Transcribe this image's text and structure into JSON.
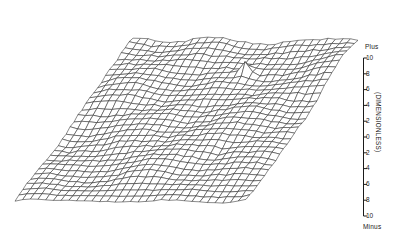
{
  "chart_data": {
    "type": "surface",
    "title": "",
    "subtitle": "",
    "xlabel": "",
    "ylabel": "(DIMENSIONLESS)",
    "zlabel": "",
    "grid": false,
    "legend_position": "none",
    "projection": "parallelogram-oblique",
    "axis": {
      "orientation": "vertical",
      "position": "right",
      "top_label": "Plus",
      "bottom_label": "Minus",
      "unit_label": "(DIMENSIONLESS)",
      "range": [
        -10,
        10
      ],
      "tick_interval": 2,
      "tick_labels": [
        "10",
        "8",
        "6",
        "4",
        "2",
        "0",
        "2",
        "4",
        "6",
        "8",
        "10"
      ],
      "tick_values": [
        10,
        8,
        6,
        4,
        2,
        0,
        -2,
        -4,
        -6,
        -8,
        -10
      ]
    },
    "mesh": {
      "rows": 16,
      "cols": 16,
      "line_color": "#2b2b2b",
      "fill_color": "#ffffff",
      "amplitude_range": [
        -3.2,
        9.5
      ],
      "spike": {
        "present": true,
        "approx_value": 9.5,
        "location": "back-right"
      },
      "z_values": [
        [
          0.4,
          1.0,
          1.5,
          1.1,
          0.5,
          1.2,
          1.9,
          1.4,
          0.9,
          1.6,
          2.2,
          1.7,
          1.1,
          1.8,
          2.4,
          1.9
        ],
        [
          0.8,
          1.4,
          2.0,
          1.5,
          0.9,
          1.6,
          2.3,
          1.8,
          1.2,
          2.0,
          2.6,
          2.1,
          1.5,
          2.2,
          2.8,
          2.3
        ],
        [
          1.2,
          1.8,
          1.3,
          1.9,
          1.4,
          2.0,
          1.5,
          2.1,
          1.6,
          2.2,
          1.7,
          2.3,
          1.8,
          2.4,
          1.9,
          2.5
        ],
        [
          0.9,
          1.5,
          2.1,
          1.6,
          1.0,
          1.7,
          2.4,
          1.9,
          1.3,
          2.1,
          2.7,
          2.2,
          1.6,
          2.3,
          2.9,
          2.4
        ],
        [
          1.5,
          0.9,
          1.6,
          2.2,
          1.7,
          1.1,
          1.8,
          2.5,
          2.0,
          1.4,
          2.2,
          2.8,
          2.3,
          1.7,
          2.4,
          3.0
        ],
        [
          0.6,
          1.2,
          1.8,
          1.3,
          0.7,
          1.4,
          2.1,
          1.6,
          1.0,
          1.8,
          2.4,
          1.9,
          1.3,
          2.0,
          2.6,
          2.1
        ],
        [
          1.1,
          1.7,
          1.2,
          1.8,
          1.3,
          1.9,
          1.4,
          2.0,
          1.5,
          2.1,
          1.6,
          2.2,
          1.7,
          2.3,
          1.8,
          2.4
        ],
        [
          1.6,
          1.0,
          1.7,
          2.3,
          1.8,
          1.2,
          1.9,
          2.6,
          2.1,
          1.5,
          2.3,
          2.9,
          2.4,
          1.8,
          2.5,
          3.1
        ],
        [
          0.7,
          1.3,
          1.9,
          1.4,
          0.8,
          1.5,
          2.2,
          1.7,
          1.1,
          1.9,
          2.5,
          2.0,
          1.4,
          2.1,
          2.7,
          2.2
        ],
        [
          1.3,
          1.9,
          1.4,
          2.0,
          1.5,
          2.1,
          1.6,
          2.2,
          1.7,
          2.3,
          1.8,
          2.4,
          1.9,
          2.5,
          2.0,
          2.6
        ],
        [
          0.5,
          1.1,
          1.7,
          1.2,
          0.6,
          1.3,
          2.0,
          1.5,
          0.9,
          1.7,
          2.3,
          1.8,
          1.2,
          1.9,
          2.5,
          2.0
        ],
        [
          1.4,
          0.8,
          1.5,
          2.1,
          1.6,
          1.0,
          1.7,
          2.4,
          1.9,
          1.3,
          2.1,
          2.7,
          2.2,
          1.6,
          2.3,
          2.9
        ],
        [
          0.9,
          1.5,
          1.0,
          1.6,
          1.1,
          1.7,
          1.2,
          1.8,
          1.3,
          1.9,
          1.4,
          2.0,
          1.5,
          2.1,
          1.6,
          2.2
        ],
        [
          1.2,
          1.8,
          2.4,
          1.9,
          1.3,
          2.0,
          2.6,
          2.1,
          1.5,
          2.2,
          2.8,
          2.3,
          1.7,
          2.4,
          3.0,
          2.5
        ],
        [
          0.6,
          1.2,
          0.7,
          1.3,
          0.8,
          1.4,
          0.9,
          1.5,
          1.0,
          1.6,
          1.1,
          1.7,
          1.2,
          1.8,
          1.3,
          1.9
        ],
        [
          1.0,
          1.6,
          2.2,
          1.7,
          1.1,
          1.8,
          2.4,
          1.9,
          1.3,
          2.0,
          2.6,
          2.1,
          1.5,
          2.2,
          2.8,
          2.3
        ]
      ]
    }
  }
}
